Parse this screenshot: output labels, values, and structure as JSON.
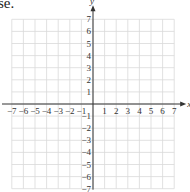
{
  "header_fragment": "se.",
  "chart_data": {
    "type": "grid",
    "title": "",
    "xlabel": "x",
    "ylabel": "y",
    "xlim": [
      -7,
      7
    ],
    "ylim": [
      -7,
      7
    ],
    "grid": true,
    "x_ticks": [
      "-7",
      "-6",
      "-5",
      "-4",
      "-3",
      "-2",
      "-1",
      "1",
      "2",
      "3",
      "4",
      "5",
      "6",
      "7"
    ],
    "y_ticks": [
      "7",
      "6",
      "5",
      "4",
      "3",
      "2",
      "1",
      "-1",
      "-2",
      "-3",
      "-4",
      "-5",
      "-6",
      "-7"
    ],
    "colors": {
      "grid": "#d9d9d9",
      "axis": "#333333"
    }
  }
}
